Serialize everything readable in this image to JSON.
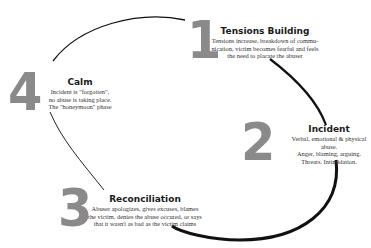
{
  "diagram": {
    "type": "cycle",
    "stages": [
      {
        "number": "1",
        "title": "Tensions Building",
        "lines": [
          "Tensions increase, breakdown of commu-",
          "nication, victim becomes fearful and feels",
          "the need to placate the abuser"
        ]
      },
      {
        "number": "2",
        "title": "Incident",
        "lines": [
          "Verbal, emotional & physical abuse.",
          "Anger, blaming, arguing.",
          "Threats.  Intimidation."
        ]
      },
      {
        "number": "3",
        "title": "Reconciliation",
        "lines": [
          "Abuser apologizes, gives excuses, blames",
          "the victim, denies the abuse occured, or says",
          "that it wasn't as bad as the victim claims"
        ]
      },
      {
        "number": "4",
        "title": "Calm",
        "lines": [
          "Incident is \"forgotten\",",
          "no abuse is taking place.",
          "The \"honeymoon\" phase"
        ]
      }
    ],
    "colors": {
      "number": "#8a8a8a",
      "arrow": "#111111",
      "text": "#1a1a1a"
    }
  }
}
